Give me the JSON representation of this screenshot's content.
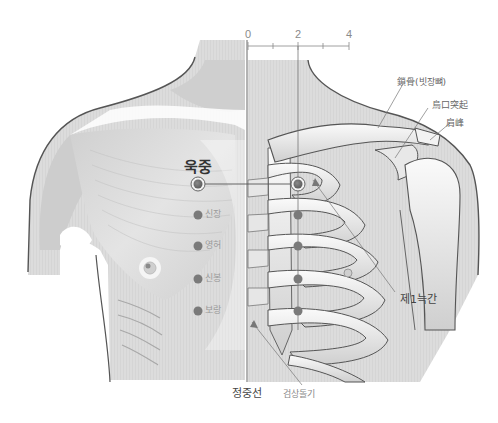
{
  "diagram": {
    "title_point": "욱중",
    "scale": {
      "ticks": [
        "0",
        "2",
        "4"
      ],
      "tick_x": [
        248,
        298,
        348
      ]
    },
    "points": [
      {
        "name": "욱중",
        "x": 198,
        "y": 184,
        "primary": true
      },
      {
        "name": "신장",
        "x": 198,
        "y": 215
      },
      {
        "name": "영허",
        "x": 198,
        "y": 246
      },
      {
        "name": "신봉",
        "x": 198,
        "y": 279
      },
      {
        "name": "보랑",
        "x": 198,
        "y": 311
      }
    ],
    "mirror_points_x": 298,
    "annotations": {
      "clavicle": "鎖骨(빗장뼈)",
      "coracoid": "烏口突起",
      "acromion": "肩峰",
      "first_intercostal": "제1늑간",
      "midline": "정중선",
      "xiphoid": "검상돌기"
    },
    "colors": {
      "point_fill": "#6e6e6e",
      "point_ring": "#888888",
      "line": "#555555",
      "muscle": "#d6d6d6",
      "bone": "#efefef",
      "shade": "#c9c9c9"
    }
  }
}
